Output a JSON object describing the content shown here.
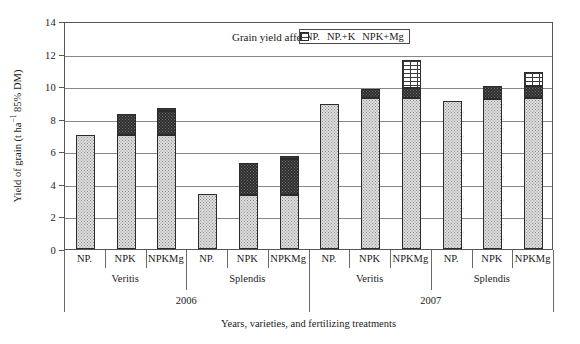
{
  "chart_data": {
    "type": "bar",
    "stacked": true,
    "title": "",
    "xlabel": "Years, varieties, and fertilizing treatments",
    "ylabel": "Yield of grain (t ha−1 85% DM)",
    "ylabel_prefix": "Yield of grain (t ha",
    "ylabel_sup": "−1",
    "ylabel_suffix": " 85% DM)",
    "ylim": [
      0,
      14
    ],
    "yticks": [
      0,
      2,
      4,
      6,
      8,
      10,
      12,
      14
    ],
    "grid": true,
    "legend_position": "top-center-inside",
    "legend_title": "Grain yield affected parts",
    "series": [
      {
        "name": "NP.",
        "key": "np",
        "values": [
          7.0,
          7.0,
          7.0,
          3.4,
          3.3,
          3.3,
          8.9,
          9.3,
          9.3,
          9.1,
          9.2,
          9.3
        ]
      },
      {
        "name": "NP.+K",
        "key": "npk",
        "values": [
          0.0,
          1.3,
          1.5,
          0.0,
          2.0,
          2.2,
          0.0,
          0.5,
          0.6,
          0.0,
          0.8,
          0.7
        ]
      },
      {
        "name": "NPK+Mg",
        "key": "npkmg",
        "values": [
          0.0,
          0.0,
          0.15,
          0.0,
          0.0,
          0.2,
          0.0,
          0.0,
          1.7,
          0.0,
          0.0,
          0.9
        ]
      }
    ],
    "categories": [
      "NP.",
      "NPK",
      "NPKMg",
      "NP.",
      "NPK",
      "NPKMg",
      "NP.",
      "NPK",
      "NPKMg",
      "NP.",
      "NPK",
      "NPKMg"
    ],
    "totals": [
      7.0,
      8.3,
      8.65,
      3.4,
      5.3,
      5.7,
      8.9,
      9.8,
      11.6,
      9.1,
      10.0,
      10.9
    ],
    "group_varieties": [
      "Veritis",
      "Splendis",
      "Veritis",
      "Splendis"
    ],
    "group_years": [
      "2006",
      "2007"
    ]
  },
  "axis": {
    "ytick_labels": [
      "0",
      "2",
      "4",
      "6",
      "8",
      "10",
      "12",
      "14"
    ],
    "treatment_labels": [
      "NP.",
      "NPK",
      "NPKMg",
      "NP.",
      "NPK",
      "NPKMg",
      "NP.",
      "NPK",
      "NPKMg",
      "NP.",
      "NPK",
      "NPKMg"
    ],
    "variety_labels": [
      "Veritis",
      "Splendis",
      "Veritis",
      "Splendis"
    ],
    "year_labels": [
      "2006",
      "2007"
    ],
    "x_title": "Years, varieties, and fertilizing treatments"
  },
  "legend": {
    "title": "Grain yield affected parts",
    "items": [
      {
        "label": "NP.",
        "key": "np"
      },
      {
        "label": "NP.+K",
        "key": "npk"
      },
      {
        "label": "NPK+Mg",
        "key": "npkmg"
      }
    ]
  },
  "colors": {
    "np": "#dedede",
    "npk": "#2e2e2e",
    "npkmg": "#ffffff",
    "axis": "#555555",
    "grid": "#888888",
    "text": "#1a1a1a"
  }
}
